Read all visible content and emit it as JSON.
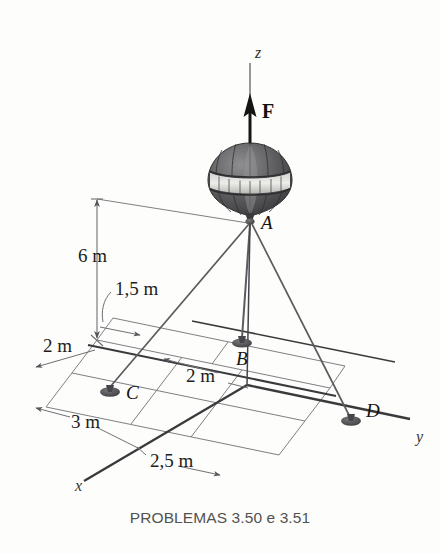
{
  "figure": {
    "caption": "PROBLEMAS 3.50 e 3.51",
    "background_color": "#fdfdfc",
    "line_color": "#55565a",
    "axis_color": "#3a3a3c",
    "balloon_dark": "#4b4b4e",
    "balloon_light": "#d9d9d6"
  },
  "axes": [
    {
      "id": "z",
      "label": "z",
      "style": "dashed-vertical"
    },
    {
      "id": "x",
      "label": "x",
      "style": "solid"
    },
    {
      "id": "y",
      "label": "y",
      "style": "solid"
    }
  ],
  "force": {
    "label": "F",
    "direction": "up",
    "applied_at": "A"
  },
  "points": [
    {
      "id": "A",
      "label": "A",
      "role": "balloon-attachment",
      "x": 250,
      "y": 222
    },
    {
      "id": "B",
      "label": "B",
      "role": "ground-anchor",
      "x": 242,
      "y": 341
    },
    {
      "id": "C",
      "label": "C",
      "role": "ground-anchor",
      "x": 108,
      "y": 390
    },
    {
      "id": "D",
      "label": "D",
      "role": "ground-anchor",
      "x": 350,
      "y": 420
    }
  ],
  "dimensions": [
    {
      "id": "height",
      "label": "6 m",
      "value": 6,
      "unit": "m",
      "orientation": "vertical"
    },
    {
      "id": "b-offset",
      "label": "1,5 m",
      "value": 1.5,
      "unit": "m",
      "orientation": "horizontal"
    },
    {
      "id": "c-offset-1",
      "label": "2 m",
      "value": 2,
      "unit": "m",
      "orientation": "horizontal"
    },
    {
      "id": "b-offset-2",
      "label": "2 m",
      "value": 2,
      "unit": "m",
      "orientation": "horizontal"
    },
    {
      "id": "c-offset-2",
      "label": "3 m",
      "value": 3,
      "unit": "m",
      "orientation": "horizontal"
    },
    {
      "id": "d-offset",
      "label": "2,5 m",
      "value": 2.5,
      "unit": "m",
      "orientation": "horizontal"
    }
  ],
  "cables": [
    {
      "from": "A",
      "to": "B"
    },
    {
      "from": "A",
      "to": "C"
    },
    {
      "from": "A",
      "to": "D"
    }
  ]
}
